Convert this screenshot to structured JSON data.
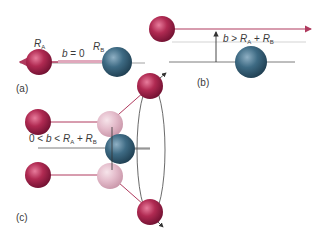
{
  "colors": {
    "molecule_a": "#a8204a",
    "molecule_a_ghost": "#e0b4c2",
    "molecule_b": "#2e5a72",
    "trajectory": "#b03a5e",
    "guide_line": "#5a5a5a",
    "faint_line": "#c8c8c8",
    "background": "#ffffff"
  },
  "panels": {
    "a": {
      "tag": "(a)",
      "radius_a_label": "R",
      "radius_a_sub": "A",
      "radius_b_label": "R",
      "radius_b_sub": "B",
      "impact_label_var": "b",
      "impact_label_rel": " = 0"
    },
    "b": {
      "tag": "(b)",
      "impact_label_var": "b",
      "impact_label_rel": " > ",
      "r1": "R",
      "r1_sub": "A",
      "plus": " + ",
      "r2": "R",
      "r2_sub": "B"
    },
    "c": {
      "tag": "(c)",
      "impact_label_pre": "0 < ",
      "impact_label_var": "b",
      "impact_label_rel": " < ",
      "r1": "R",
      "r1_sub": "A",
      "plus": " + ",
      "r2": "R",
      "r2_sub": "B"
    }
  }
}
